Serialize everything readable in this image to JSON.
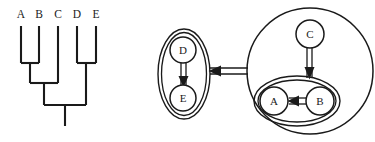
{
  "figure": {
    "background_color": "#ffffff",
    "ink_color": "#1a1a1a"
  },
  "tree": {
    "name": "cladogram",
    "tip_labels": [
      "A",
      "B",
      "C",
      "D",
      "E"
    ],
    "tip_x": [
      21,
      39,
      58,
      77,
      96
    ],
    "label_y": 14,
    "tip_top_y": 26,
    "clades": [
      {
        "name": "AB",
        "members": [
          "A",
          "B"
        ],
        "join_y": 63,
        "center_x": 30
      },
      {
        "name": "DE",
        "members": [
          "D",
          "E"
        ],
        "join_y": 63,
        "center_x": 86
      },
      {
        "name": "ABC",
        "members": [
          "AB",
          "C"
        ],
        "join_y": 83,
        "center_x": 44
      },
      {
        "name": "root",
        "members": [
          "ABC",
          "DE"
        ],
        "join_y": 105,
        "center_x": 65
      }
    ],
    "root_stem_bottom_y": 126
  },
  "graph": {
    "name": "nested-containment-graph",
    "nodes": [
      {
        "id": "D",
        "label": "D",
        "cx": 183,
        "cy": 50,
        "r": 13
      },
      {
        "id": "E",
        "label": "E",
        "cx": 183,
        "cy": 98,
        "r": 13
      },
      {
        "id": "C",
        "label": "C",
        "cx": 310,
        "cy": 34,
        "r": 14
      },
      {
        "id": "A",
        "label": "A",
        "cx": 274,
        "cy": 101,
        "r": 14
      },
      {
        "id": "B",
        "label": "B",
        "cx": 320,
        "cy": 101,
        "r": 14
      }
    ],
    "groups": [
      {
        "id": "DE",
        "label": "",
        "shape": "ellipse",
        "double_border": true,
        "cx": 184,
        "cy": 74,
        "rx": 26,
        "ry": 45
      },
      {
        "id": "AB",
        "label": "",
        "shape": "ellipse",
        "double_border": true,
        "cx": 297,
        "cy": 101,
        "rx": 43,
        "ry": 25
      },
      {
        "id": "BIG",
        "label": "",
        "shape": "circle",
        "double_border": false,
        "cx": 310,
        "cy": 71,
        "r": 63
      }
    ],
    "edges": [
      {
        "from": "D",
        "to": "E",
        "style": "double-line",
        "direction": "down"
      },
      {
        "from": "B",
        "to": "A",
        "style": "double-line",
        "direction": "left"
      },
      {
        "from": "C",
        "to": "AB",
        "style": "double-line",
        "direction": "down"
      },
      {
        "from": "BIG",
        "to": "DE",
        "style": "double-line",
        "direction": "left"
      }
    ]
  }
}
